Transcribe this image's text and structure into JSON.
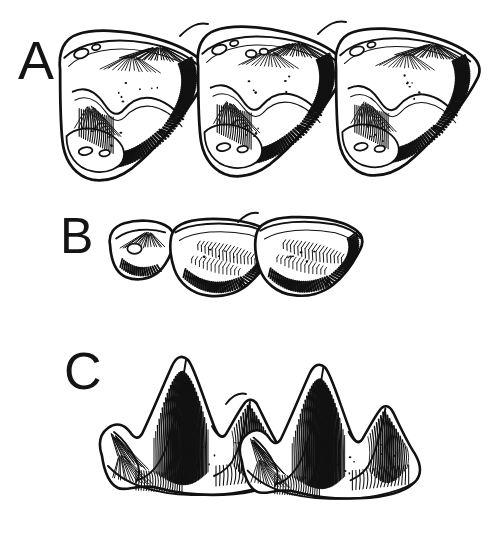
{
  "figure": {
    "kind": "scientific-line-illustration",
    "background_color": "#ffffff",
    "ink_color": "#111111",
    "width": 497,
    "height": 536,
    "panels": [
      {
        "id": "A",
        "label": "A",
        "label_x": 18,
        "label_y": 33,
        "tooth_count": 3,
        "description": "row of three worn bunodont molars in lateral view",
        "bbox": [
          63,
          28,
          478,
          195
        ]
      },
      {
        "id": "B",
        "label": "B",
        "label_x": 60,
        "label_y": 211,
        "tooth_count": 2,
        "description": "row of two low-crowned teeth in lateral view",
        "bbox": [
          110,
          215,
          385,
          302
        ]
      },
      {
        "id": "C",
        "label": "C",
        "label_x": 64,
        "label_y": 345,
        "tooth_count": 2,
        "description": "row of two sharply cusped sectorial teeth in lateral view",
        "bbox": [
          100,
          355,
          400,
          515
        ]
      }
    ]
  }
}
